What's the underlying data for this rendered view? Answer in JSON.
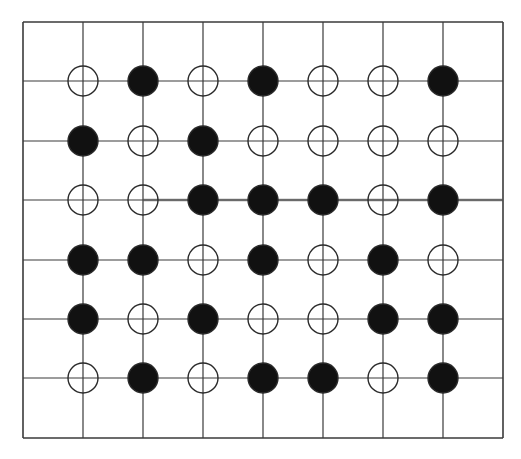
{
  "diagram": {
    "title": "",
    "grid": {
      "x_lines": [
        23,
        83,
        143,
        203,
        263,
        323,
        383,
        443,
        503
      ],
      "y_lines": [
        22,
        81,
        141,
        200,
        260,
        319,
        378,
        438
      ],
      "line_color": "#3a3a3a",
      "bold_line": {
        "row": 2,
        "x_from": 143,
        "x_to": 503
      }
    },
    "node_radius": 15,
    "legend": {
      "filled": "black",
      "open": "white"
    },
    "colors": {
      "filled": "#111111",
      "open_fill": "#ffffff",
      "stroke": "#2a2a2a"
    },
    "rows": [
      [
        "O",
        "X",
        "O",
        "X",
        "O",
        "O",
        "X"
      ],
      [
        "X",
        "O",
        "X",
        "O",
        "O",
        "O",
        "O"
      ],
      [
        "O",
        "O",
        "X",
        "X",
        "X",
        "O",
        "X"
      ],
      [
        "X",
        "X",
        "O",
        "X",
        "O",
        "X",
        "O"
      ],
      [
        "X",
        "O",
        "X",
        "O",
        "O",
        "X",
        "X"
      ],
      [
        "O",
        "X",
        "O",
        "X",
        "X",
        "O",
        "X"
      ]
    ]
  }
}
